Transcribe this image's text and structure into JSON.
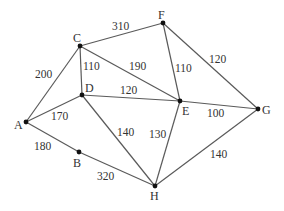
{
  "diagram": {
    "type": "weighted-undirected-graph",
    "nodes": [
      {
        "id": "A",
        "label": "A",
        "x": 26,
        "y": 122,
        "lx": 14,
        "ly": 129
      },
      {
        "id": "B",
        "label": "B",
        "x": 79,
        "y": 152,
        "lx": 73,
        "ly": 167
      },
      {
        "id": "C",
        "label": "C",
        "x": 80,
        "y": 46,
        "lx": 73,
        "ly": 42
      },
      {
        "id": "D",
        "label": "D",
        "x": 82,
        "y": 95,
        "lx": 85,
        "ly": 92
      },
      {
        "id": "E",
        "label": "E",
        "x": 180,
        "y": 101,
        "lx": 182,
        "ly": 115
      },
      {
        "id": "F",
        "label": "F",
        "x": 163,
        "y": 23,
        "lx": 158,
        "ly": 19
      },
      {
        "id": "G",
        "label": "G",
        "x": 258,
        "y": 109,
        "lx": 262,
        "ly": 114
      },
      {
        "id": "H",
        "label": "H",
        "x": 155,
        "y": 186,
        "lx": 150,
        "ly": 200
      }
    ],
    "edges": [
      {
        "from": "A",
        "to": "C",
        "weight": "200",
        "lx": 35,
        "ly": 78
      },
      {
        "from": "C",
        "to": "F",
        "weight": "310",
        "lx": 112,
        "ly": 30
      },
      {
        "from": "C",
        "to": "D",
        "weight": "110",
        "lx": 83,
        "ly": 70
      },
      {
        "from": "C",
        "to": "E",
        "weight": "190",
        "lx": 129,
        "ly": 70
      },
      {
        "from": "F",
        "to": "E",
        "weight": "110",
        "lx": 175,
        "ly": 72
      },
      {
        "from": "F",
        "to": "G",
        "weight": "120",
        "lx": 209,
        "ly": 63
      },
      {
        "from": "D",
        "to": "E",
        "weight": "120",
        "lx": 120,
        "ly": 94
      },
      {
        "from": "A",
        "to": "D",
        "weight": "170",
        "lx": 51,
        "ly": 120
      },
      {
        "from": "D",
        "to": "H",
        "weight": "140",
        "lx": 117,
        "ly": 136
      },
      {
        "from": "E",
        "to": "H",
        "weight": "130",
        "lx": 149,
        "ly": 138
      },
      {
        "from": "E",
        "to": "G",
        "weight": "100",
        "lx": 207,
        "ly": 117
      },
      {
        "from": "A",
        "to": "B",
        "weight": "180",
        "lx": 34,
        "ly": 150
      },
      {
        "from": "B",
        "to": "H",
        "weight": "320",
        "lx": 97,
        "ly": 180
      },
      {
        "from": "G",
        "to": "H",
        "weight": "140",
        "lx": 210,
        "ly": 158
      }
    ]
  }
}
